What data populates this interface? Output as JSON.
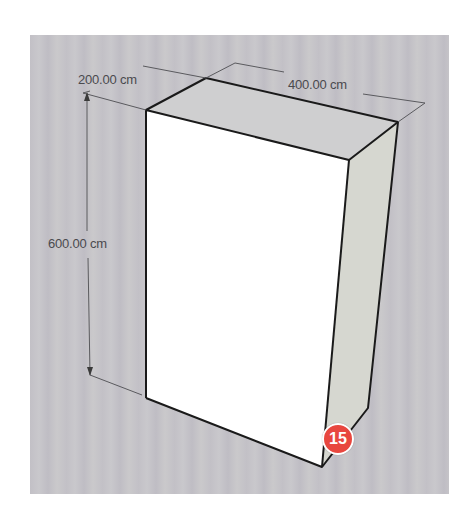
{
  "diagram": {
    "type": "3d-box-dimensions",
    "dimensions": {
      "depth": "200.00 cm",
      "width": "400.00 cm",
      "height": "600.00 cm"
    },
    "step_badge": "15"
  },
  "colors": {
    "canvas_gray": "#c5c4c8",
    "front_face": "#ffffff",
    "side_face": "#d6d7d0",
    "top_face": "#c9c9c9",
    "edge": "#1a1a1a",
    "dimension_line": "#555555",
    "badge_red": "#e8473f"
  }
}
